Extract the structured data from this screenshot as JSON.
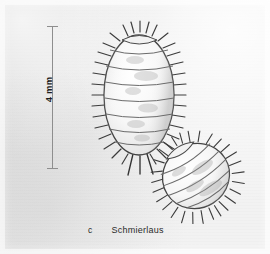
{
  "figure": {
    "caption_letter": "c",
    "caption_text": "Schmierlaus",
    "scale_bar": {
      "label": "4 mm",
      "value": 4,
      "unit": "mm",
      "orientation": "vertical"
    },
    "background_color": "#e9e9e9",
    "ink_color": "#3a3a3a",
    "specimens": [
      {
        "name": "mealybug-dorsal-upper",
        "view": "dorsal",
        "orientation_degrees": 0,
        "body_segments": 7,
        "marginal_filaments": 34,
        "caudal_filaments": 3
      },
      {
        "name": "mealybug-oblique-lower",
        "view": "oblique",
        "orientation_degrees": -32,
        "body_segments": 7,
        "marginal_filaments": 30,
        "caudal_filaments": 3
      }
    ]
  }
}
